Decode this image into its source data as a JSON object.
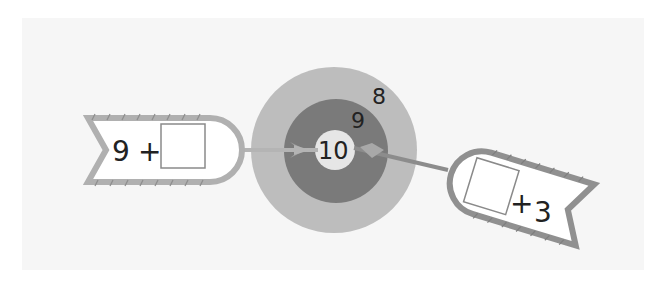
{
  "diagram": {
    "type": "dartboard-number-bond",
    "colors": {
      "background_panel": "#f6f6f6",
      "outer_ring": "#bdbdbd",
      "middle_ring": "#7a7a7a",
      "bullseye": "#e6e6e6",
      "dart": "#a8a8a8",
      "banner_stroke": "#9c9c9c",
      "box_stroke": "#8a8a8a",
      "text": "#222222"
    },
    "target": {
      "rings": [
        {
          "label": "8",
          "ring": "outer"
        },
        {
          "label": "9",
          "ring": "middle"
        },
        {
          "label": "10",
          "ring": "bullseye"
        }
      ]
    },
    "left_banner": {
      "left_operand": "9",
      "operator": "+",
      "answer_box": ""
    },
    "right_banner": {
      "answer_box": "",
      "operator": "+",
      "right_operand": "3"
    }
  }
}
